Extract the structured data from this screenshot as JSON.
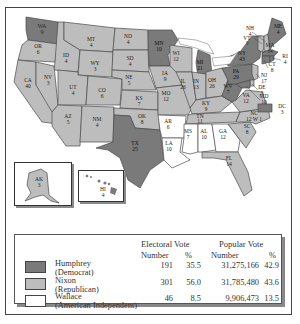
{
  "map": {
    "title": "1968 Presidential Election",
    "colors": {
      "humphrey": "#7a7a7a",
      "nixon": "#bdbdbd",
      "wallace": "#ffffff"
    },
    "states": [
      {
        "abbr": "WA",
        "ev": "9",
        "winner": "humphrey"
      },
      {
        "abbr": "OR",
        "ev": "6",
        "winner": "nixon"
      },
      {
        "abbr": "CA",
        "ev": "40",
        "winner": "nixon"
      },
      {
        "abbr": "ID",
        "ev": "4",
        "winner": "nixon"
      },
      {
        "abbr": "NV",
        "ev": "3",
        "winner": "nixon"
      },
      {
        "abbr": "MT",
        "ev": "4",
        "winner": "nixon"
      },
      {
        "abbr": "WY",
        "ev": "3",
        "winner": "nixon"
      },
      {
        "abbr": "UT",
        "ev": "4",
        "winner": "nixon"
      },
      {
        "abbr": "AZ",
        "ev": "5",
        "winner": "nixon"
      },
      {
        "abbr": "CO",
        "ev": "6",
        "winner": "nixon"
      },
      {
        "abbr": "NM",
        "ev": "4",
        "winner": "nixon"
      },
      {
        "abbr": "ND",
        "ev": "4",
        "winner": "nixon"
      },
      {
        "abbr": "SD",
        "ev": "4",
        "winner": "nixon"
      },
      {
        "abbr": "NE",
        "ev": "5",
        "winner": "nixon"
      },
      {
        "abbr": "KS",
        "ev": "7",
        "winner": "nixon"
      },
      {
        "abbr": "OK",
        "ev": "8",
        "winner": "nixon"
      },
      {
        "abbr": "TX",
        "ev": "25",
        "winner": "humphrey"
      },
      {
        "abbr": "MN",
        "ev": "10",
        "winner": "humphrey"
      },
      {
        "abbr": "IA",
        "ev": "9",
        "winner": "nixon"
      },
      {
        "abbr": "MO",
        "ev": "12",
        "winner": "nixon"
      },
      {
        "abbr": "AR",
        "ev": "6",
        "winner": "wallace"
      },
      {
        "abbr": "LA",
        "ev": "10",
        "winner": "wallace"
      },
      {
        "abbr": "WI",
        "ev": "12",
        "winner": "nixon"
      },
      {
        "abbr": "IL",
        "ev": "26",
        "winner": "nixon"
      },
      {
        "abbr": "MI",
        "ev": "21",
        "winner": "humphrey"
      },
      {
        "abbr": "IN",
        "ev": "13",
        "winner": "nixon"
      },
      {
        "abbr": "OH",
        "ev": "26",
        "winner": "nixon"
      },
      {
        "abbr": "KY",
        "ev": "9",
        "winner": "nixon"
      },
      {
        "abbr": "TN",
        "ev": "11",
        "winner": "nixon"
      },
      {
        "abbr": "MS",
        "ev": "7",
        "winner": "wallace"
      },
      {
        "abbr": "AL",
        "ev": "10",
        "winner": "wallace"
      },
      {
        "abbr": "GA",
        "ev": "12",
        "winner": "wallace"
      },
      {
        "abbr": "FL",
        "ev": "14",
        "winner": "nixon"
      },
      {
        "abbr": "SC",
        "ev": "8",
        "winner": "nixon"
      },
      {
        "abbr": "NC",
        "ev": "12",
        "winner": "nixon"
      },
      {
        "abbr": "NC-W",
        "ev": "1 W",
        "winner": "wallace"
      },
      {
        "abbr": "VA",
        "ev": "12",
        "winner": "nixon"
      },
      {
        "abbr": "WV",
        "ev": "7",
        "winner": "humphrey"
      },
      {
        "abbr": "PA",
        "ev": "29",
        "winner": "humphrey"
      },
      {
        "abbr": "NY",
        "ev": "43",
        "winner": "humphrey"
      },
      {
        "abbr": "VT",
        "ev": "3",
        "winner": "nixon"
      },
      {
        "abbr": "NH",
        "ev": "4",
        "winner": "nixon"
      },
      {
        "abbr": "ME",
        "ev": "4",
        "winner": "humphrey"
      },
      {
        "abbr": "MA",
        "ev": "14",
        "winner": "humphrey"
      },
      {
        "abbr": "RI",
        "ev": "4",
        "winner": "humphrey"
      },
      {
        "abbr": "CT",
        "ev": "8",
        "winner": "humphrey"
      },
      {
        "abbr": "NJ",
        "ev": "17",
        "winner": "nixon"
      },
      {
        "abbr": "DE",
        "ev": "3",
        "winner": "nixon"
      },
      {
        "abbr": "MD",
        "ev": "10",
        "winner": "humphrey"
      },
      {
        "abbr": "DC",
        "ev": "3",
        "winner": "humphrey"
      },
      {
        "abbr": "AK",
        "ev": "3",
        "winner": "nixon"
      },
      {
        "abbr": "HI",
        "ev": "4",
        "winner": "humphrey"
      }
    ]
  },
  "legend": {
    "headers": {
      "electoral": "Electoral Vote",
      "popular": "Popular Vote",
      "number": "Number",
      "percent": "%"
    },
    "candidates": [
      {
        "name": "Humphrey",
        "party": "(Democrat)",
        "ev_number": "191",
        "ev_pct": "35.5",
        "pop_number": "31,275,166",
        "pop_pct": "42.9"
      },
      {
        "name": "Nixon",
        "party": "(Republican)",
        "ev_number": "301",
        "ev_pct": "56.0",
        "pop_number": "31,785,480",
        "pop_pct": "43.6"
      },
      {
        "name": "Wallace",
        "party": "(American Independent)",
        "ev_number": "46",
        "ev_pct": "8.5",
        "pop_number": "9,906,473",
        "pop_pct": "13.5"
      }
    ]
  }
}
